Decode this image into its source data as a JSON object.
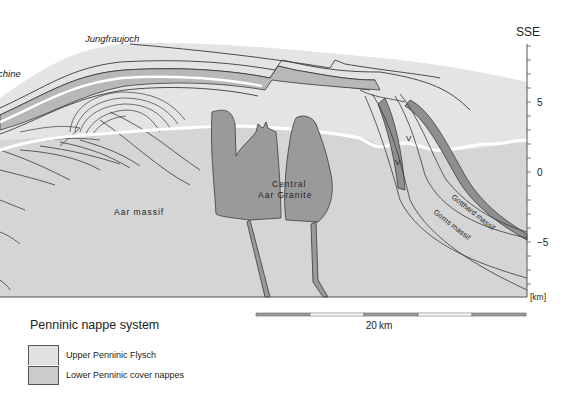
{
  "figure": {
    "place_labels": {
      "jungfraujoch": "Jungfraujoch",
      "left_cut": "chine",
      "direction": "SSE"
    },
    "unit_labels": {
      "aar_massif": "Aar massif",
      "central_aar_granite_line1": "Central",
      "central_aar_granite_line2": "Aar Granite",
      "gotthard_massif": "Gotthard massif",
      "gorns_massif": "Gorns massif",
      "v_mark_1": "V",
      "v_mark_2": "V"
    },
    "depth_axis": {
      "unit_label": "[km]",
      "tick_labels": [
        {
          "value": 5,
          "text": "5"
        },
        {
          "value": 0,
          "text": "0"
        },
        {
          "value": -5,
          "text": "−5"
        }
      ],
      "minor_tick_step_km": 1,
      "range_km": [
        -9,
        9
      ]
    },
    "scale_bar": {
      "label": "20 km",
      "segments": 5
    },
    "colors": {
      "upper_penninic_flysch": "#e2e2e2",
      "lower_penninic_cover": "#c9c9c9",
      "massif_basement": "#d6d6d6",
      "granite": "#9a9a9a",
      "dark_band": "#8f8f8f",
      "line": "#3a3a3a",
      "surface_white": "#ffffff"
    }
  },
  "legend": {
    "title": "Penninic nappe system",
    "items": [
      {
        "label": "Upper Penninic Flysch",
        "color": "#e2e2e2"
      },
      {
        "label": "Lower Penninic cover nappes",
        "color": "#cbcbcb"
      }
    ]
  }
}
